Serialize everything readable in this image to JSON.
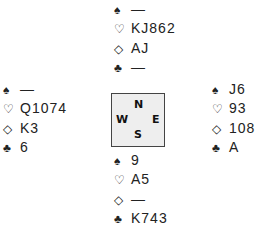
{
  "suits": {
    "spades": "♠",
    "hearts": "♡",
    "diamonds": "◇",
    "clubs": "♣"
  },
  "compass": {
    "north": "N",
    "west": "W",
    "east": "E",
    "south": "S",
    "fill_color": "#eeeeee",
    "border_color": "#444444"
  },
  "hands": {
    "north": {
      "spades": "—",
      "hearts": "KJ862",
      "diamonds": "AJ",
      "clubs": "—"
    },
    "west": {
      "spades": "—",
      "hearts": "Q1074",
      "diamonds": "K3",
      "clubs": "6"
    },
    "east": {
      "spades": "J6",
      "hearts": "93",
      "diamonds": "108",
      "clubs": "A"
    },
    "south": {
      "spades": "9",
      "hearts": "A5",
      "diamonds": "—",
      "clubs": "K743"
    }
  }
}
